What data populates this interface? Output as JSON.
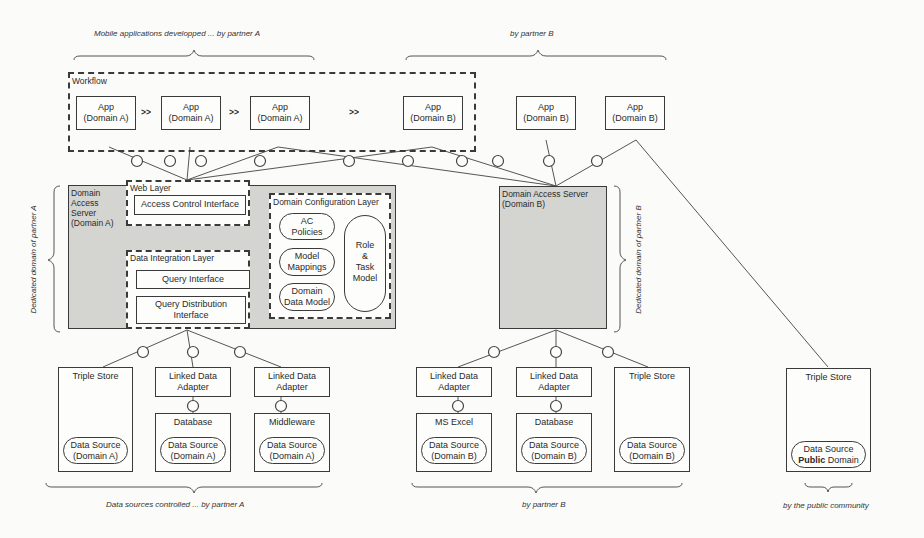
{
  "braces": {
    "top_a": "Mobile applications developped ... by partner A",
    "top_b": "by partner B",
    "side_a": "Dedicated domain of partner A",
    "side_b": "Dedicated domain of partner B",
    "bottom_a": "Data sources controlled ... by partner A",
    "bottom_b": "by partner B",
    "bottom_public": "by the public community"
  },
  "workflow": {
    "label": "Workflow",
    "separator": ">>",
    "apps": [
      {
        "title": "App",
        "domain": "(Domain A)"
      },
      {
        "title": "App",
        "domain": "(Domain A)"
      },
      {
        "title": "App",
        "domain": "(Domain A)"
      },
      {
        "title": "App",
        "domain": "(Domain B)"
      }
    ]
  },
  "standalone_apps": [
    {
      "title": "App",
      "domain": "(Domain B)"
    },
    {
      "title": "App",
      "domain": "(Domain B)"
    }
  ],
  "server_a": {
    "label": "Domain Access Server (Domain A)",
    "label_lines": [
      "Domain",
      "Access",
      "Server",
      "(Domain A)"
    ],
    "web_layer": {
      "label": "Web Layer",
      "access_control": "Access Control Interface"
    },
    "data_integration_layer": {
      "label": "Data Integration Layer",
      "query_interface": "Query Interface",
      "query_distribution": [
        "Query Distribution",
        "Interface"
      ]
    },
    "domain_configuration_layer": {
      "label": "Domain Configuration Layer",
      "ac_policies": [
        "AC",
        "Policies"
      ],
      "model_mappings": [
        "Model",
        "Mappings"
      ],
      "domain_data_model": [
        "Domain",
        "Data Model"
      ],
      "role_task_model": [
        "Role",
        "&",
        "Task",
        "Model"
      ]
    }
  },
  "server_b": {
    "label_lines": [
      "Domain Access Server",
      "(Domain B)"
    ]
  },
  "sources_a": [
    {
      "header": "Triple Store",
      "adapter": null,
      "ds": [
        "Data Source",
        "(Domain A)"
      ]
    },
    {
      "header": "Database",
      "adapter": [
        "Linked Data",
        "Adapter"
      ],
      "ds": [
        "Data Source",
        "(Domain A)"
      ]
    },
    {
      "header": "Middleware",
      "adapter": [
        "Linked Data",
        "Adapter"
      ],
      "ds": [
        "Data Source",
        "(Domain A)"
      ]
    }
  ],
  "sources_b": [
    {
      "header": "MS Excel",
      "adapter": [
        "Linked Data",
        "Adapter"
      ],
      "ds": [
        "Data Source",
        "(Domain B)"
      ]
    },
    {
      "header": "Database",
      "adapter": [
        "Linked Data",
        "Adapter"
      ],
      "ds": [
        "Data Source",
        "(Domain B)"
      ]
    },
    {
      "header": "Triple Store",
      "adapter": null,
      "ds": [
        "Data Source",
        "(Domain B)"
      ]
    }
  ],
  "source_public": {
    "header": "Triple Store",
    "ds": [
      "Data Source",
      "Public Domain"
    ]
  },
  "colors": {
    "shade": "#d4d4d0",
    "line": "#3a3a3a",
    "background": "#fbfbf9"
  }
}
